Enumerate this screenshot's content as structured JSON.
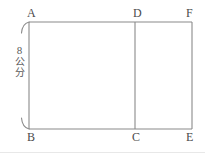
{
  "figure": {
    "stroke_color": "#8a8a8a",
    "label_color": "#4a4a4a",
    "background_color": "#ffffff",
    "vertices": {
      "A": "A",
      "B": "B",
      "C": "C",
      "D": "D",
      "E": "E",
      "F": "F"
    },
    "dimension": {
      "value": "8",
      "unit_char_1": "公",
      "unit_char_2": "分",
      "full_text": "8 公分",
      "side": "left",
      "measures": "AB"
    },
    "geometry": {
      "rect_left_x": 29,
      "rect_right_x": 192,
      "rect_top_y": 22,
      "rect_bottom_y": 129,
      "divider_x": 135
    }
  }
}
